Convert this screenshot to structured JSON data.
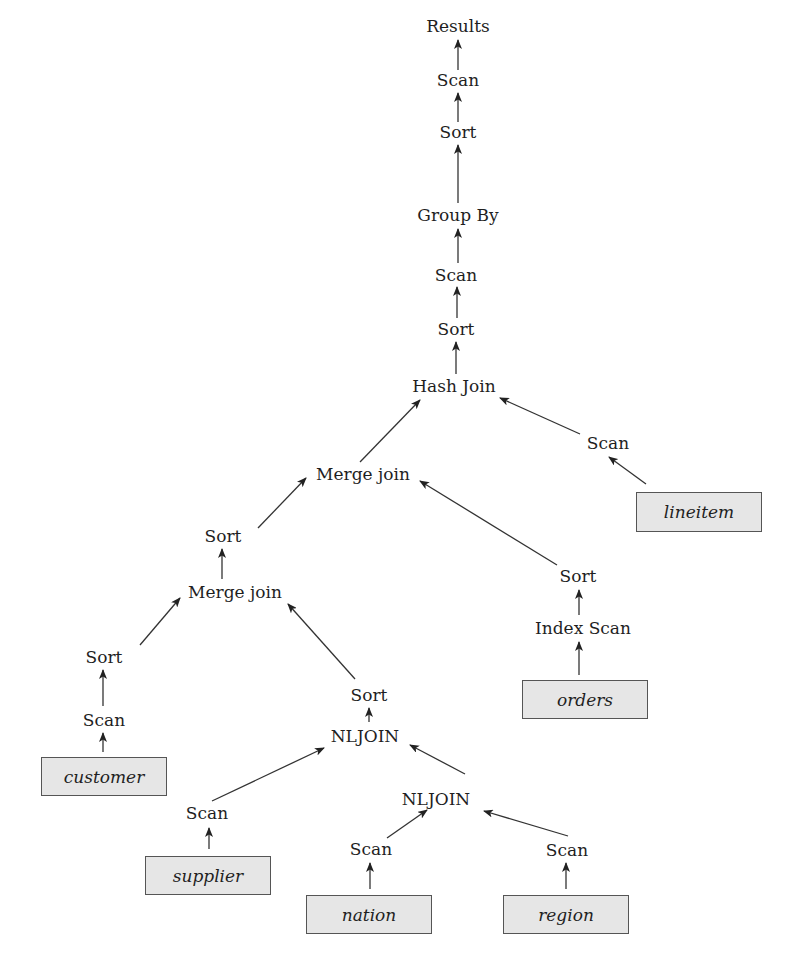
{
  "diagram": {
    "title": "",
    "type": "query-execution-plan-tree",
    "operators": [
      {
        "id": "results",
        "label": "Results",
        "x": 458,
        "y": 26
      },
      {
        "id": "scan1",
        "label": "Scan",
        "x": 458,
        "y": 80
      },
      {
        "id": "sort1",
        "label": "Sort",
        "x": 458,
        "y": 132
      },
      {
        "id": "groupby",
        "label": "Group By",
        "x": 458,
        "y": 215
      },
      {
        "id": "scan2",
        "label": "Scan",
        "x": 456,
        "y": 275
      },
      {
        "id": "sort2",
        "label": "Sort",
        "x": 456,
        "y": 329
      },
      {
        "id": "hashjoin",
        "label": "Hash Join",
        "x": 454,
        "y": 386
      },
      {
        "id": "scan_lineitem",
        "label": "Scan",
        "x": 608,
        "y": 443
      },
      {
        "id": "mergejoin1",
        "label": "Merge join",
        "x": 363,
        "y": 474
      },
      {
        "id": "sort3",
        "label": "Sort",
        "x": 223,
        "y": 536
      },
      {
        "id": "mergejoin2",
        "label": "Merge join",
        "x": 235,
        "y": 592
      },
      {
        "id": "sort_orders",
        "label": "Sort",
        "x": 578,
        "y": 576
      },
      {
        "id": "indexscan",
        "label": "Index Scan",
        "x": 583,
        "y": 628
      },
      {
        "id": "sort4",
        "label": "Sort",
        "x": 104,
        "y": 657
      },
      {
        "id": "scan_customer",
        "label": "Scan",
        "x": 104,
        "y": 720
      },
      {
        "id": "sort5",
        "label": "Sort",
        "x": 369,
        "y": 695
      },
      {
        "id": "nljoin1",
        "label": "NLJOIN",
        "x": 365,
        "y": 736
      },
      {
        "id": "scan_supplier",
        "label": "Scan",
        "x": 207,
        "y": 813
      },
      {
        "id": "nljoin2",
        "label": "NLJOIN",
        "x": 436,
        "y": 799
      },
      {
        "id": "scan_nation",
        "label": "Scan",
        "x": 371,
        "y": 849
      },
      {
        "id": "scan_region",
        "label": "Scan",
        "x": 567,
        "y": 850
      }
    ],
    "tables": [
      {
        "id": "lineitem",
        "label": "lineitem",
        "x": 636,
        "y": 492,
        "w": 126,
        "h": 40
      },
      {
        "id": "orders",
        "label": "orders",
        "x": 522,
        "y": 680,
        "w": 126,
        "h": 39
      },
      {
        "id": "customer",
        "label": "customer",
        "x": 41,
        "y": 757,
        "w": 126,
        "h": 39
      },
      {
        "id": "supplier",
        "label": "supplier",
        "x": 145,
        "y": 856,
        "w": 126,
        "h": 39
      },
      {
        "id": "nation",
        "label": "nation",
        "x": 306,
        "y": 895,
        "w": 126,
        "h": 39
      },
      {
        "id": "region",
        "label": "region",
        "x": 503,
        "y": 895,
        "w": 126,
        "h": 39
      }
    ],
    "edges": [
      {
        "from": "scan1",
        "to": "results",
        "x1": 458,
        "y1": 70,
        "x2": 458,
        "y2": 40
      },
      {
        "from": "sort1",
        "to": "scan1",
        "x1": 458,
        "y1": 122,
        "x2": 458,
        "y2": 93
      },
      {
        "from": "groupby",
        "to": "sort1",
        "x1": 458,
        "y1": 203,
        "x2": 458,
        "y2": 145
      },
      {
        "from": "scan2",
        "to": "groupby",
        "x1": 458,
        "y1": 263,
        "x2": 458,
        "y2": 229
      },
      {
        "from": "sort2",
        "to": "scan2",
        "x1": 457,
        "y1": 318,
        "x2": 457,
        "y2": 287
      },
      {
        "from": "hashjoin",
        "to": "sort2",
        "x1": 456,
        "y1": 374,
        "x2": 456,
        "y2": 342
      },
      {
        "from": "mergejoin1",
        "to": "hashjoin",
        "x1": 360,
        "y1": 462,
        "x2": 420,
        "y2": 400
      },
      {
        "from": "scan_lineitem",
        "to": "hashjoin",
        "x1": 580,
        "y1": 434,
        "x2": 500,
        "y2": 398
      },
      {
        "from": "lineitem",
        "to": "scan_lineitem",
        "x1": 646,
        "y1": 484,
        "x2": 609,
        "y2": 457
      },
      {
        "from": "sort3",
        "to": "mergejoin1",
        "x1": 258,
        "y1": 528,
        "x2": 306,
        "y2": 478
      },
      {
        "from": "sort_orders",
        "to": "mergejoin1",
        "x1": 557,
        "y1": 565,
        "x2": 420,
        "y2": 481
      },
      {
        "from": "mergejoin2",
        "to": "sort3",
        "x1": 222,
        "y1": 579,
        "x2": 222,
        "y2": 549
      },
      {
        "from": "indexscan",
        "to": "sort_orders",
        "x1": 579,
        "y1": 615,
        "x2": 579,
        "y2": 590
      },
      {
        "from": "orders",
        "to": "indexscan",
        "x1": 579,
        "y1": 675,
        "x2": 579,
        "y2": 642
      },
      {
        "from": "sort4",
        "to": "mergejoin2",
        "x1": 140,
        "y1": 645,
        "x2": 180,
        "y2": 598
      },
      {
        "from": "sort5",
        "to": "mergejoin2",
        "x1": 355,
        "y1": 679,
        "x2": 288,
        "y2": 604
      },
      {
        "from": "scan_customer",
        "to": "sort4",
        "x1": 103,
        "y1": 706,
        "x2": 103,
        "y2": 670
      },
      {
        "from": "customer",
        "to": "scan_customer",
        "x1": 103,
        "y1": 752,
        "x2": 103,
        "y2": 733
      },
      {
        "from": "nljoin1",
        "to": "sort5",
        "x1": 369,
        "y1": 722,
        "x2": 369,
        "y2": 708
      },
      {
        "from": "scan_supplier",
        "to": "nljoin1",
        "x1": 212,
        "y1": 801,
        "x2": 324,
        "y2": 748
      },
      {
        "from": "nljoin2",
        "to": "nljoin1",
        "x1": 465,
        "y1": 774,
        "x2": 410,
        "y2": 745
      },
      {
        "from": "supplier",
        "to": "scan_supplier",
        "x1": 209,
        "y1": 849,
        "x2": 209,
        "y2": 828
      },
      {
        "from": "scan_nation",
        "to": "nljoin2",
        "x1": 387,
        "y1": 838,
        "x2": 427,
        "y2": 810
      },
      {
        "from": "scan_region",
        "to": "nljoin2",
        "x1": 568,
        "y1": 836,
        "x2": 484,
        "y2": 811
      },
      {
        "from": "nation",
        "to": "scan_nation",
        "x1": 370,
        "y1": 889,
        "x2": 370,
        "y2": 863
      },
      {
        "from": "region",
        "to": "scan_region",
        "x1": 566,
        "y1": 889,
        "x2": 566,
        "y2": 863
      }
    ],
    "colors": {
      "text": "#1f1f1f",
      "edge": "#333333",
      "table_fill": "#e6e6e6",
      "table_border": "#555555",
      "background": "#ffffff"
    }
  }
}
